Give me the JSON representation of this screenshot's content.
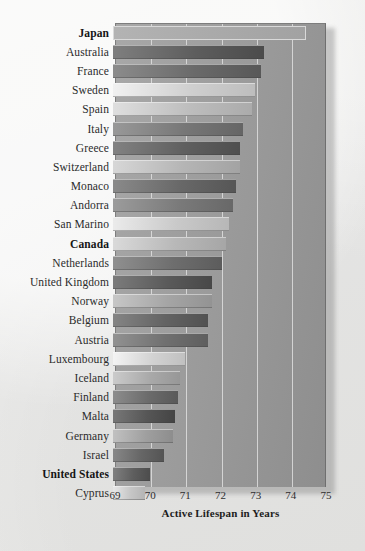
{
  "chart_data": {
    "type": "bar",
    "orientation": "horizontal",
    "title": "",
    "xlabel": "Active Lifespan in Years",
    "ylabel": "",
    "xlim": [
      69,
      75
    ],
    "xticks": [
      69,
      70,
      71,
      72,
      73,
      74,
      75
    ],
    "xtick_labels": [
      "69",
      "70",
      "71",
      "72",
      "73",
      "74",
      "75"
    ],
    "grid": true,
    "legend": null,
    "categories": [
      "Japan",
      "Australia",
      "France",
      "Sweden",
      "Spain",
      "Italy",
      "Greece",
      "Switzerland",
      "Monaco",
      "Andorra",
      "San Marino",
      "Canada",
      "Netherlands",
      "United Kingdom",
      "Norway",
      "Belgium",
      "Austria",
      "Luxembourg",
      "Iceland",
      "Finland",
      "Malta",
      "Germany",
      "Israel",
      "United States",
      "Cyprus"
    ],
    "values": [
      74.5,
      73.3,
      73.2,
      73.05,
      72.95,
      72.7,
      72.6,
      72.6,
      72.5,
      72.4,
      72.3,
      72.2,
      72.1,
      71.8,
      71.8,
      71.7,
      71.7,
      71.05,
      70.9,
      70.85,
      70.75,
      70.7,
      70.45,
      70.05,
      69.9
    ],
    "highlighted": [
      "Japan",
      "Canada",
      "United States"
    ],
    "bar_shades": [
      "#b0b0b0",
      "#5d5d5d",
      "#6a6a6a",
      "#cfcfcf",
      "#bdbdbd",
      "#777777",
      "#606060",
      "#b5b5b5",
      "#686868",
      "#7a7a7a",
      "#c9c9c9",
      "#b8b8b8",
      "#6e6e6e",
      "#5a5a5a",
      "#a5a5a5",
      "#636363",
      "#707070",
      "#d2d2d2",
      "#a9a9a9",
      "#6b6b6b",
      "#565656",
      "#9f9f9f",
      "#666666",
      "#5e5e5e",
      "#c6c6c6"
    ],
    "units": "years"
  },
  "colors": {
    "panel": "#9d9d9d",
    "page_background": "#eeeeec",
    "gridline": "#e8e8e8",
    "text": "#2b2b2b"
  }
}
